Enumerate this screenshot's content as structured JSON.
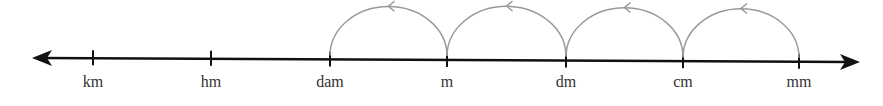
{
  "diagram": {
    "type": "number-line",
    "direction": "bidirectional",
    "units": [
      {
        "label": "km",
        "x": 93
      },
      {
        "label": "hm",
        "x": 211
      },
      {
        "label": "dam",
        "x": 330
      },
      {
        "label": "m",
        "x": 447
      },
      {
        "label": "dm",
        "x": 566
      },
      {
        "label": "cm",
        "x": 683
      },
      {
        "label": "mm",
        "x": 799
      }
    ],
    "arcs": [
      {
        "from": "m",
        "to": "dam",
        "direction": "left"
      },
      {
        "from": "dm",
        "to": "m",
        "direction": "left"
      },
      {
        "from": "cm",
        "to": "dm",
        "direction": "left"
      },
      {
        "from": "mm",
        "to": "cm",
        "direction": "left"
      }
    ],
    "colors": {
      "line": "#111111",
      "arc": "#9a9a9a",
      "label": "#333333"
    }
  }
}
